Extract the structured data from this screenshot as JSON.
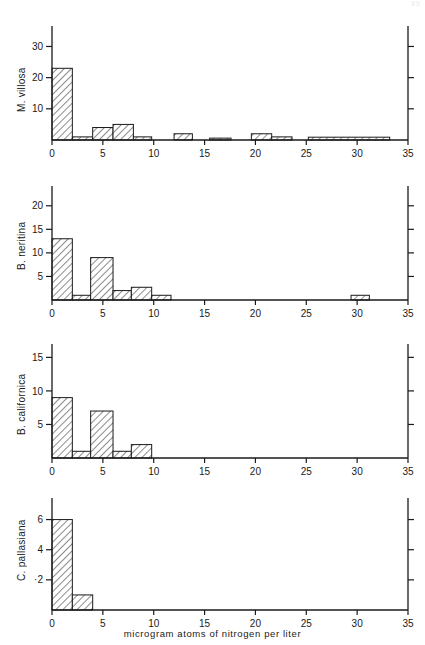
{
  "figure": {
    "page_artifact_right": "89",
    "xaxis_title": "microgram atoms of nitrogen per liter",
    "ink_color": "#1a1a1a",
    "background_color": "#ffffff",
    "hatch_color": "#1a1a1a"
  },
  "chart_data": [
    {
      "type": "bar",
      "title": "M. villosa",
      "series_label": "M. villosa",
      "xlabel": "microgram atoms of nitrogen per liter",
      "ylabel": "M. villosa",
      "xlim": [
        0,
        35
      ],
      "ylim": [
        0,
        34
      ],
      "xticks": [
        0,
        5,
        10,
        15,
        20,
        25,
        30,
        35
      ],
      "xticklabels": [
        "0",
        "5",
        "10",
        "15",
        "20",
        "25",
        "30",
        "35"
      ],
      "yticks": [
        10,
        20,
        30
      ],
      "yticklabels": [
        "10",
        "20",
        "30"
      ],
      "grid": false,
      "legend": "none",
      "bars": [
        {
          "x0": 0.0,
          "x1": 2.0,
          "value": 23
        },
        {
          "x0": 2.0,
          "x1": 4.0,
          "value": 1
        },
        {
          "x0": 4.0,
          "x1": 6.0,
          "value": 4
        },
        {
          "x0": 6.0,
          "x1": 8.0,
          "value": 5
        },
        {
          "x0": 8.0,
          "x1": 9.8,
          "value": 1
        },
        {
          "x0": 12.0,
          "x1": 13.8,
          "value": 2
        },
        {
          "x0": 15.5,
          "x1": 17.6,
          "value": 0.6
        },
        {
          "x0": 19.6,
          "x1": 21.6,
          "value": 2
        },
        {
          "x0": 21.6,
          "x1": 23.6,
          "value": 1
        },
        {
          "x0": 25.2,
          "x1": 33.2,
          "value": 0.9
        }
      ]
    },
    {
      "type": "bar",
      "title": "B. neritina",
      "series_label": "B. neritina",
      "xlabel": "microgram atoms of nitrogen per liter",
      "ylabel": "B. neritina",
      "xlim": [
        0,
        35
      ],
      "ylim": [
        0,
        22.5
      ],
      "xticks": [
        0,
        5,
        10,
        15,
        20,
        25,
        30,
        35
      ],
      "xticklabels": [
        "0",
        "5",
        "10",
        "15",
        "20",
        "25",
        "30",
        "35"
      ],
      "yticks": [
        5,
        10,
        15,
        20
      ],
      "yticklabels": [
        "5",
        "10",
        "15",
        "20"
      ],
      "grid": false,
      "legend": "none",
      "bars": [
        {
          "x0": 0.0,
          "x1": 2.0,
          "value": 13
        },
        {
          "x0": 2.0,
          "x1": 3.8,
          "value": 1
        },
        {
          "x0": 3.8,
          "x1": 6.0,
          "value": 9
        },
        {
          "x0": 6.0,
          "x1": 7.8,
          "value": 2
        },
        {
          "x0": 7.8,
          "x1": 9.8,
          "value": 2.7
        },
        {
          "x0": 9.8,
          "x1": 11.7,
          "value": 1
        },
        {
          "x0": 29.4,
          "x1": 31.2,
          "value": 1
        }
      ]
    },
    {
      "type": "bar",
      "title": "B. californica",
      "series_label": "B. californica",
      "xlabel": "microgram atoms of nitrogen per liter",
      "ylabel": "B. californica",
      "xlim": [
        0,
        35
      ],
      "ylim": [
        0,
        15.8
      ],
      "xticks": [
        0,
        5,
        10,
        15,
        20,
        25,
        30,
        35
      ],
      "xticklabels": [
        "0",
        "5",
        "10",
        "15",
        "20",
        "25",
        "30",
        "35"
      ],
      "yticks": [
        5,
        10,
        15
      ],
      "yticklabels": [
        "5",
        "10",
        "15"
      ],
      "grid": false,
      "legend": "none",
      "bars": [
        {
          "x0": 0.0,
          "x1": 2.0,
          "value": 9
        },
        {
          "x0": 2.0,
          "x1": 3.8,
          "value": 1
        },
        {
          "x0": 3.8,
          "x1": 6.0,
          "value": 7
        },
        {
          "x0": 6.0,
          "x1": 7.8,
          "value": 1
        },
        {
          "x0": 7.8,
          "x1": 9.8,
          "value": 2
        }
      ]
    },
    {
      "type": "bar",
      "title": "C. pallasiana",
      "series_label": "C. pallasiana",
      "xlabel": "microgram atoms of nitrogen per liter",
      "ylabel": "C. pallasiana",
      "xlim": [
        0,
        35
      ],
      "ylim": [
        0,
        6.9
      ],
      "xticks": [
        0,
        5,
        10,
        15,
        20,
        25,
        30,
        35
      ],
      "xticklabels": [
        "0",
        "5",
        "10",
        "15",
        "20",
        "25",
        "30",
        "35"
      ],
      "yticks": [
        2,
        4,
        6
      ],
      "yticklabels": [
        "·2",
        "4",
        "6"
      ],
      "grid": false,
      "legend": "none",
      "bars": [
        {
          "x0": 0.0,
          "x1": 2.0,
          "value": 6
        },
        {
          "x0": 2.0,
          "x1": 4.0,
          "value": 1
        }
      ]
    }
  ]
}
